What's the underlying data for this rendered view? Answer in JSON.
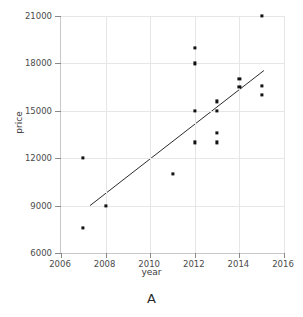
{
  "chart_data": {
    "type": "scatter",
    "title": "",
    "panel_label": "A",
    "xlabel": "year",
    "ylabel": "price",
    "xlim": [
      2006,
      2016
    ],
    "ylim": [
      6000,
      21000
    ],
    "xticks": [
      2006,
      2008,
      2010,
      2012,
      2014,
      2016
    ],
    "xticklabels": [
      "2006",
      "2008",
      "2010",
      "2012",
      "2014",
      "2016"
    ],
    "yticks": [
      6000,
      9000,
      12000,
      15000,
      18000,
      21000
    ],
    "yticklabels": [
      "6000",
      "9000",
      "12000",
      "15000",
      "18000",
      "21000"
    ],
    "grid": true,
    "legend": "none",
    "points": [
      {
        "x": 2007,
        "y": 12000
      },
      {
        "x": 2007,
        "y": 7600
      },
      {
        "x": 2008,
        "y": 9000
      },
      {
        "x": 2011,
        "y": 11000
      },
      {
        "x": 2012,
        "y": 19000
      },
      {
        "x": 2012,
        "y": 18000
      },
      {
        "x": 2012,
        "y": 15000
      },
      {
        "x": 2012,
        "y": 13000
      },
      {
        "x": 2013,
        "y": 15600
      },
      {
        "x": 2013,
        "y": 15000
      },
      {
        "x": 2013,
        "y": 13600
      },
      {
        "x": 2013,
        "y": 13000
      },
      {
        "x": 2014,
        "y": 17000
      },
      {
        "x": 2014,
        "y": 16500
      },
      {
        "x": 2015,
        "y": 21000
      },
      {
        "x": 2015,
        "y": 16600
      },
      {
        "x": 2015,
        "y": 16000
      }
    ],
    "trendline": {
      "x_start": 2007.3,
      "y_start": 9000,
      "x_end": 2015.1,
      "y_end": 17550,
      "color": "#2b2b2b"
    },
    "colors": {
      "point": "#121212",
      "grid": "#e6e6e6",
      "axis": "#c9c9c9",
      "text": "#3a3a3a",
      "background": "#ffffff"
    }
  }
}
